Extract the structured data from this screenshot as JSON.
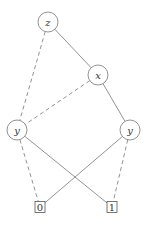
{
  "diagram": {
    "type": "binary-decision-diagram",
    "nodes": [
      {
        "id": "z",
        "label": "z",
        "shape": "circle",
        "cx": 48,
        "cy": 22,
        "r": 10
      },
      {
        "id": "x",
        "label": "x",
        "shape": "circle",
        "cx": 98,
        "cy": 75,
        "r": 10
      },
      {
        "id": "yl",
        "label": "y",
        "shape": "circle",
        "cx": 17,
        "cy": 130,
        "r": 10
      },
      {
        "id": "yr",
        "label": "y",
        "shape": "circle",
        "cx": 130,
        "cy": 130,
        "r": 10
      },
      {
        "id": "t0",
        "label": "0",
        "shape": "box",
        "cx": 40,
        "cy": 207,
        "w": 10,
        "h": 11
      },
      {
        "id": "t1",
        "label": "1",
        "shape": "box",
        "cx": 112,
        "cy": 207,
        "w": 10,
        "h": 11
      }
    ],
    "edges": [
      {
        "from": "z",
        "to": "x",
        "style": "solid"
      },
      {
        "from": "z",
        "to": "yl",
        "style": "dashed"
      },
      {
        "from": "x",
        "to": "yl",
        "style": "dashed"
      },
      {
        "from": "x",
        "to": "yr",
        "style": "solid"
      },
      {
        "from": "yl",
        "to": "t0",
        "style": "dashed"
      },
      {
        "from": "yl",
        "to": "t1",
        "style": "solid"
      },
      {
        "from": "yr",
        "to": "t0",
        "style": "solid"
      },
      {
        "from": "yr",
        "to": "t1",
        "style": "dashed"
      }
    ],
    "colors": {
      "stroke": "#777777",
      "text": "#333333",
      "background": "#ffffff"
    }
  }
}
